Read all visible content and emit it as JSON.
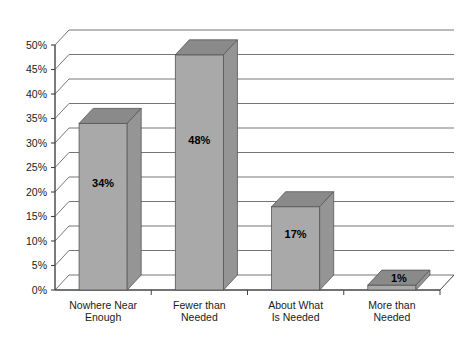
{
  "chart_data": {
    "type": "bar",
    "title": "",
    "subtitle": "",
    "xlabel": "",
    "ylabel": "",
    "categories": [
      "Nowhere Near Enough",
      "Fewer than Needed",
      "About What Is Needed",
      "More than Needed"
    ],
    "category_lines": [
      [
        "Nowhere Near",
        "Enough"
      ],
      [
        "Fewer than",
        "Needed"
      ],
      [
        "About What",
        "Is Needed"
      ],
      [
        "More than",
        "Needed"
      ]
    ],
    "values": [
      34,
      48,
      17,
      1
    ],
    "value_labels": [
      "34%",
      "48%",
      "17%",
      "1%"
    ],
    "ylim": [
      0,
      50
    ],
    "ytick_values": [
      0,
      5,
      10,
      15,
      20,
      25,
      30,
      35,
      40,
      45,
      50
    ],
    "ytick_labels": [
      "0%",
      "5%",
      "10%",
      "15%",
      "20%",
      "25%",
      "30%",
      "35%",
      "40%",
      "45%",
      "50%"
    ],
    "grid": true,
    "legend": "none",
    "style": "3d-columns",
    "colors": {
      "bar_front": "#a9a9a9",
      "bar_top": "#8a8a8a",
      "bar_side": "#959595",
      "bar_edge": "#555555",
      "gridline": "#666666",
      "axis": "#444444",
      "background": "#ffffff",
      "text": "#1a1a1a"
    }
  }
}
